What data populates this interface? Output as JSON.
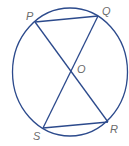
{
  "diagram": {
    "stroke_color": "#2c4a8c",
    "label_color": "#6b6b6b",
    "circle": {
      "cx": 70,
      "cy": 72,
      "rx": 57.5,
      "ry": 64
    },
    "points": {
      "P": {
        "label": "P",
        "x": 35,
        "y": 22
      },
      "Q": {
        "label": "Q",
        "x": 98,
        "y": 16
      },
      "R": {
        "label": "R",
        "x": 108,
        "y": 122
      },
      "S": {
        "label": "S",
        "x": 43,
        "y": 128
      },
      "O": {
        "label": "O",
        "x": 71,
        "y": 72
      }
    },
    "segments": [
      {
        "from": "P",
        "to": "Q"
      },
      {
        "from": "S",
        "to": "R"
      },
      {
        "from": "P",
        "to": "R"
      },
      {
        "from": "Q",
        "to": "S"
      }
    ]
  }
}
